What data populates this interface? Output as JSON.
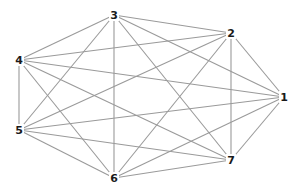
{
  "graph": {
    "type": "complete-graph",
    "name": "K7",
    "edge_color": "#9a9a9a",
    "label_color": "#1a1a1a",
    "nodes": [
      {
        "id": "1",
        "label": "1"
      },
      {
        "id": "2",
        "label": "2"
      },
      {
        "id": "3",
        "label": "3"
      },
      {
        "id": "4",
        "label": "4"
      },
      {
        "id": "5",
        "label": "5"
      },
      {
        "id": "6",
        "label": "6"
      },
      {
        "id": "7",
        "label": "7"
      }
    ],
    "edges": [
      [
        "1",
        "2"
      ],
      [
        "1",
        "3"
      ],
      [
        "1",
        "4"
      ],
      [
        "1",
        "5"
      ],
      [
        "1",
        "6"
      ],
      [
        "1",
        "7"
      ],
      [
        "2",
        "3"
      ],
      [
        "2",
        "4"
      ],
      [
        "2",
        "5"
      ],
      [
        "2",
        "6"
      ],
      [
        "2",
        "7"
      ],
      [
        "3",
        "4"
      ],
      [
        "3",
        "5"
      ],
      [
        "3",
        "6"
      ],
      [
        "3",
        "7"
      ],
      [
        "4",
        "5"
      ],
      [
        "4",
        "6"
      ],
      [
        "4",
        "7"
      ],
      [
        "5",
        "6"
      ],
      [
        "5",
        "7"
      ],
      [
        "6",
        "7"
      ]
    ]
  }
}
